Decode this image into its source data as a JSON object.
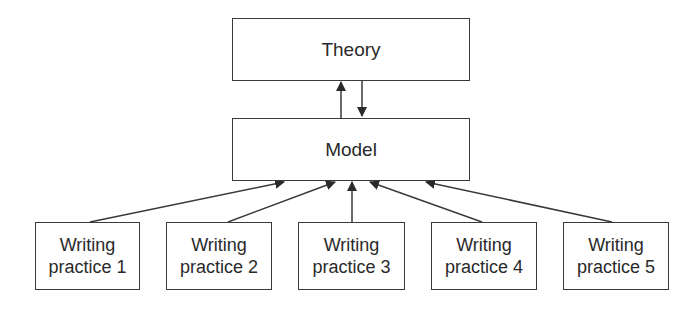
{
  "diagram": {
    "nodes": {
      "theory": {
        "label": "Theory"
      },
      "model": {
        "label": "Model"
      },
      "practices": [
        {
          "line1": "Writing",
          "line2": "practice 1"
        },
        {
          "line1": "Writing",
          "line2": "practice 2"
        },
        {
          "line1": "Writing",
          "line2": "practice 3"
        },
        {
          "line1": "Writing",
          "line2": "practice 4"
        },
        {
          "line1": "Writing",
          "line2": "practice 5"
        }
      ]
    },
    "edges": [
      {
        "from": "model",
        "to": "theory"
      },
      {
        "from": "theory",
        "to": "model"
      },
      {
        "from": "practice 1",
        "to": "model"
      },
      {
        "from": "practice 2",
        "to": "model"
      },
      {
        "from": "practice 3",
        "to": "model"
      },
      {
        "from": "practice 4",
        "to": "model"
      },
      {
        "from": "practice 5",
        "to": "model"
      }
    ],
    "colors": {
      "stroke": "#3a3a3a",
      "text": "#2a2a2a",
      "background": "#ffffff"
    }
  }
}
